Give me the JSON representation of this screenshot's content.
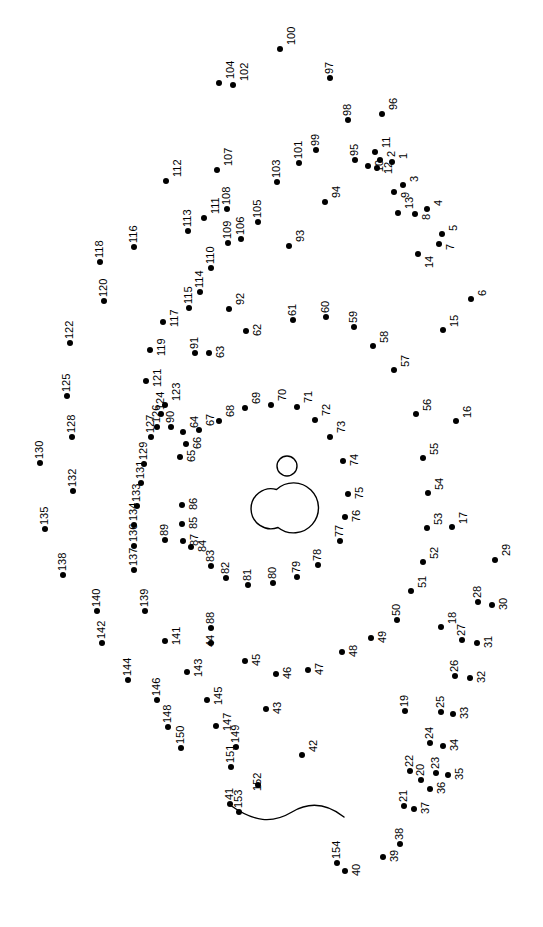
{
  "page": {
    "width": 543,
    "height": 927,
    "background_color": "#ffffff",
    "dot_color": "#000000",
    "label_color": "#000000",
    "label_rotation_degrees": -90,
    "dot_radius_px": 3,
    "total_dots": 154
  },
  "figure": {
    "stroke_color": "#000000",
    "stroke_width": 1.4,
    "fill": "none",
    "shapes": [
      {
        "name": "small-circle-top",
        "type": "circle",
        "cx": 287,
        "cy": 466,
        "r": 10
      },
      {
        "name": "body-circle-large",
        "type": "circle",
        "cx": 297,
        "cy": 508,
        "r": 25
      },
      {
        "name": "body-circle-small",
        "type": "circle",
        "cx": 262,
        "cy": 513,
        "r": 20
      },
      {
        "name": "tail-curve",
        "type": "path",
        "d": "M 230 805 C 254 822, 272 824, 292 812, 312 800, 330 806, 344 817"
      }
    ]
  },
  "dots": [
    {
      "n": "1",
      "x": 392,
      "y": 162,
      "lx": 398,
      "ly": 159
    },
    {
      "n": "2",
      "x": 380,
      "y": 160,
      "lx": 386,
      "ly": 157
    },
    {
      "n": "3",
      "x": 403,
      "y": 185,
      "lx": 409,
      "ly": 182
    },
    {
      "n": "4",
      "x": 427,
      "y": 209,
      "lx": 433,
      "ly": 206
    },
    {
      "n": "5",
      "x": 442,
      "y": 234,
      "lx": 448,
      "ly": 231
    },
    {
      "n": "6",
      "x": 471,
      "y": 299,
      "lx": 477,
      "ly": 296
    },
    {
      "n": "7",
      "x": 439,
      "y": 244,
      "lx": 445,
      "ly": 250
    },
    {
      "n": "8",
      "x": 415,
      "y": 214,
      "lx": 421,
      "ly": 220
    },
    {
      "n": "9",
      "x": 394,
      "y": 192,
      "lx": 400,
      "ly": 198
    },
    {
      "n": "10",
      "x": 368,
      "y": 166,
      "lx": 374,
      "ly": 172
    },
    {
      "n": "11",
      "x": 375,
      "y": 152,
      "lx": 381,
      "ly": 148
    },
    {
      "n": "12",
      "x": 377,
      "y": 168,
      "lx": 383,
      "ly": 174
    },
    {
      "n": "13",
      "x": 398,
      "y": 213,
      "lx": 404,
      "ly": 209
    },
    {
      "n": "14",
      "x": 418,
      "y": 254,
      "lx": 424,
      "ly": 268
    },
    {
      "n": "15",
      "x": 443,
      "y": 330,
      "lx": 449,
      "ly": 327
    },
    {
      "n": "16",
      "x": 456,
      "y": 421,
      "lx": 462,
      "ly": 418
    },
    {
      "n": "17",
      "x": 452,
      "y": 527,
      "lx": 458,
      "ly": 524
    },
    {
      "n": "18",
      "x": 441,
      "y": 627,
      "lx": 447,
      "ly": 624
    },
    {
      "n": "19",
      "x": 405,
      "y": 711,
      "lx": 399,
      "ly": 707
    },
    {
      "n": "20",
      "x": 421,
      "y": 780,
      "lx": 415,
      "ly": 776
    },
    {
      "n": "21",
      "x": 404,
      "y": 806,
      "lx": 398,
      "ly": 802
    },
    {
      "n": "22",
      "x": 410,
      "y": 771,
      "lx": 404,
      "ly": 767
    },
    {
      "n": "23",
      "x": 436,
      "y": 773,
      "lx": 430,
      "ly": 769
    },
    {
      "n": "24",
      "x": 430,
      "y": 743,
      "lx": 424,
      "ly": 739
    },
    {
      "n": "25",
      "x": 441,
      "y": 712,
      "lx": 435,
      "ly": 708
    },
    {
      "n": "26",
      "x": 455,
      "y": 676,
      "lx": 449,
      "ly": 672
    },
    {
      "n": "27",
      "x": 462,
      "y": 640,
      "lx": 456,
      "ly": 636
    },
    {
      "n": "28",
      "x": 478,
      "y": 602,
      "lx": 472,
      "ly": 598
    },
    {
      "n": "29",
      "x": 495,
      "y": 560,
      "lx": 501,
      "ly": 556
    },
    {
      "n": "30",
      "x": 492,
      "y": 605,
      "lx": 498,
      "ly": 610
    },
    {
      "n": "31",
      "x": 477,
      "y": 643,
      "lx": 483,
      "ly": 648
    },
    {
      "n": "32",
      "x": 470,
      "y": 678,
      "lx": 476,
      "ly": 683
    },
    {
      "n": "33",
      "x": 453,
      "y": 714,
      "lx": 459,
      "ly": 719
    },
    {
      "n": "34",
      "x": 443,
      "y": 746,
      "lx": 449,
      "ly": 751
    },
    {
      "n": "35",
      "x": 448,
      "y": 775,
      "lx": 454,
      "ly": 780
    },
    {
      "n": "36",
      "x": 430,
      "y": 789,
      "lx": 436,
      "ly": 794
    },
    {
      "n": "37",
      "x": 414,
      "y": 809,
      "lx": 420,
      "ly": 814
    },
    {
      "n": "38",
      "x": 400,
      "y": 844,
      "lx": 394,
      "ly": 840
    },
    {
      "n": "39",
      "x": 383,
      "y": 857,
      "lx": 389,
      "ly": 862
    },
    {
      "n": "40",
      "x": 345,
      "y": 871,
      "lx": 351,
      "ly": 876
    },
    {
      "n": "41",
      "x": 230,
      "y": 804,
      "lx": 224,
      "ly": 800
    },
    {
      "n": "42",
      "x": 302,
      "y": 755,
      "lx": 308,
      "ly": 752
    },
    {
      "n": "43",
      "x": 266,
      "y": 709,
      "lx": 272,
      "ly": 714
    },
    {
      "n": "44",
      "x": 211,
      "y": 643,
      "lx": 205,
      "ly": 647
    },
    {
      "n": "45",
      "x": 245,
      "y": 661,
      "lx": 251,
      "ly": 666
    },
    {
      "n": "46",
      "x": 276,
      "y": 674,
      "lx": 282,
      "ly": 679
    },
    {
      "n": "47",
      "x": 308,
      "y": 670,
      "lx": 314,
      "ly": 675
    },
    {
      "n": "48",
      "x": 342,
      "y": 652,
      "lx": 348,
      "ly": 657
    },
    {
      "n": "49",
      "x": 371,
      "y": 638,
      "lx": 377,
      "ly": 643
    },
    {
      "n": "50",
      "x": 397,
      "y": 620,
      "lx": 391,
      "ly": 616
    },
    {
      "n": "51",
      "x": 411,
      "y": 591,
      "lx": 417,
      "ly": 588
    },
    {
      "n": "52",
      "x": 423,
      "y": 562,
      "lx": 429,
      "ly": 559
    },
    {
      "n": "53",
      "x": 427,
      "y": 528,
      "lx": 433,
      "ly": 525
    },
    {
      "n": "54",
      "x": 428,
      "y": 493,
      "lx": 434,
      "ly": 490
    },
    {
      "n": "55",
      "x": 423,
      "y": 458,
      "lx": 429,
      "ly": 455
    },
    {
      "n": "56",
      "x": 416,
      "y": 414,
      "lx": 422,
      "ly": 411
    },
    {
      "n": "57",
      "x": 394,
      "y": 370,
      "lx": 400,
      "ly": 367
    },
    {
      "n": "58",
      "x": 373,
      "y": 346,
      "lx": 379,
      "ly": 343
    },
    {
      "n": "59",
      "x": 354,
      "y": 327,
      "lx": 348,
      "ly": 323
    },
    {
      "n": "60",
      "x": 326,
      "y": 317,
      "lx": 320,
      "ly": 313
    },
    {
      "n": "61",
      "x": 293,
      "y": 320,
      "lx": 287,
      "ly": 316
    },
    {
      "n": "62",
      "x": 246,
      "y": 331,
      "lx": 252,
      "ly": 336
    },
    {
      "n": "63",
      "x": 209,
      "y": 353,
      "lx": 215,
      "ly": 358
    },
    {
      "n": "64",
      "x": 183,
      "y": 432,
      "lx": 189,
      "ly": 428
    },
    {
      "n": "65",
      "x": 180,
      "y": 457,
      "lx": 186,
      "ly": 462
    },
    {
      "n": "66",
      "x": 186,
      "y": 444,
      "lx": 192,
      "ly": 449
    },
    {
      "n": "67",
      "x": 199,
      "y": 430,
      "lx": 205,
      "ly": 426
    },
    {
      "n": "68",
      "x": 219,
      "y": 421,
      "lx": 225,
      "ly": 417
    },
    {
      "n": "69",
      "x": 245,
      "y": 408,
      "lx": 251,
      "ly": 404
    },
    {
      "n": "70",
      "x": 271,
      "y": 405,
      "lx": 277,
      "ly": 401
    },
    {
      "n": "71",
      "x": 297,
      "y": 407,
      "lx": 303,
      "ly": 403
    },
    {
      "n": "72",
      "x": 315,
      "y": 420,
      "lx": 321,
      "ly": 416
    },
    {
      "n": "73",
      "x": 330,
      "y": 437,
      "lx": 336,
      "ly": 433
    },
    {
      "n": "74",
      "x": 343,
      "y": 461,
      "lx": 349,
      "ly": 466
    },
    {
      "n": "75",
      "x": 348,
      "y": 494,
      "lx": 354,
      "ly": 499
    },
    {
      "n": "76",
      "x": 345,
      "y": 517,
      "lx": 351,
      "ly": 522
    },
    {
      "n": "77",
      "x": 340,
      "y": 541,
      "lx": 334,
      "ly": 537
    },
    {
      "n": "78",
      "x": 318,
      "y": 565,
      "lx": 312,
      "ly": 561
    },
    {
      "n": "79",
      "x": 297,
      "y": 577,
      "lx": 291,
      "ly": 573
    },
    {
      "n": "80",
      "x": 273,
      "y": 583,
      "lx": 267,
      "ly": 579
    },
    {
      "n": "81",
      "x": 248,
      "y": 585,
      "lx": 242,
      "ly": 581
    },
    {
      "n": "82",
      "x": 226,
      "y": 578,
      "lx": 220,
      "ly": 574
    },
    {
      "n": "83",
      "x": 211,
      "y": 566,
      "lx": 205,
      "ly": 562
    },
    {
      "n": "84",
      "x": 191,
      "y": 547,
      "lx": 197,
      "ly": 552
    },
    {
      "n": "85",
      "x": 182,
      "y": 524,
      "lx": 188,
      "ly": 529
    },
    {
      "n": "86",
      "x": 182,
      "y": 505,
      "lx": 188,
      "ly": 510
    },
    {
      "n": "87",
      "x": 183,
      "y": 541,
      "lx": 189,
      "ly": 546
    },
    {
      "n": "88",
      "x": 211,
      "y": 628,
      "lx": 205,
      "ly": 624
    },
    {
      "n": "89",
      "x": 165,
      "y": 540,
      "lx": 159,
      "ly": 536
    },
    {
      "n": "90",
      "x": 171,
      "y": 427,
      "lx": 165,
      "ly": 423
    },
    {
      "n": "91",
      "x": 195,
      "y": 353,
      "lx": 189,
      "ly": 349
    },
    {
      "n": "92",
      "x": 229,
      "y": 309,
      "lx": 235,
      "ly": 305
    },
    {
      "n": "93",
      "x": 289,
      "y": 246,
      "lx": 295,
      "ly": 242
    },
    {
      "n": "94",
      "x": 325,
      "y": 202,
      "lx": 331,
      "ly": 198
    },
    {
      "n": "95",
      "x": 355,
      "y": 160,
      "lx": 349,
      "ly": 156
    },
    {
      "n": "96",
      "x": 382,
      "y": 114,
      "lx": 388,
      "ly": 110
    },
    {
      "n": "97",
      "x": 330,
      "y": 78,
      "lx": 324,
      "ly": 74
    },
    {
      "n": "98",
      "x": 348,
      "y": 120,
      "lx": 342,
      "ly": 116
    },
    {
      "n": "99",
      "x": 316,
      "y": 150,
      "lx": 310,
      "ly": 146
    },
    {
      "n": "100",
      "x": 280,
      "y": 49,
      "lx": 286,
      "ly": 45
    },
    {
      "n": "101",
      "x": 299,
      "y": 163,
      "lx": 293,
      "ly": 159
    },
    {
      "n": "102",
      "x": 233,
      "y": 85,
      "lx": 239,
      "ly": 81
    },
    {
      "n": "103",
      "x": 277,
      "y": 182,
      "lx": 271,
      "ly": 178
    },
    {
      "n": "104",
      "x": 219,
      "y": 83,
      "lx": 225,
      "ly": 79
    },
    {
      "n": "105",
      "x": 258,
      "y": 222,
      "lx": 252,
      "ly": 218
    },
    {
      "n": "106",
      "x": 241,
      "y": 239,
      "lx": 235,
      "ly": 235
    },
    {
      "n": "107",
      "x": 217,
      "y": 170,
      "lx": 223,
      "ly": 166
    },
    {
      "n": "108",
      "x": 227,
      "y": 209,
      "lx": 221,
      "ly": 205
    },
    {
      "n": "109",
      "x": 228,
      "y": 243,
      "lx": 222,
      "ly": 239
    },
    {
      "n": "110",
      "x": 211,
      "y": 268,
      "lx": 205,
      "ly": 264
    },
    {
      "n": "111",
      "x": 204,
      "y": 218,
      "lx": 210,
      "ly": 214
    },
    {
      "n": "112",
      "x": 166,
      "y": 181,
      "lx": 172,
      "ly": 177
    },
    {
      "n": "113",
      "x": 188,
      "y": 231,
      "lx": 182,
      "ly": 227
    },
    {
      "n": "114",
      "x": 200,
      "y": 292,
      "lx": 194,
      "ly": 288
    },
    {
      "n": "115",
      "x": 189,
      "y": 308,
      "lx": 183,
      "ly": 304
    },
    {
      "n": "116",
      "x": 134,
      "y": 247,
      "lx": 128,
      "ly": 243
    },
    {
      "n": "117",
      "x": 163,
      "y": 322,
      "lx": 169,
      "ly": 327
    },
    {
      "n": "118",
      "x": 100,
      "y": 262,
      "lx": 94,
      "ly": 258
    },
    {
      "n": "119",
      "x": 150,
      "y": 350,
      "lx": 156,
      "ly": 356
    },
    {
      "n": "120",
      "x": 104,
      "y": 301,
      "lx": 98,
      "ly": 297
    },
    {
      "n": "121",
      "x": 146,
      "y": 381,
      "lx": 152,
      "ly": 387
    },
    {
      "n": "122",
      "x": 70,
      "y": 343,
      "lx": 64,
      "ly": 339
    },
    {
      "n": "123",
      "x": 165,
      "y": 405,
      "lx": 171,
      "ly": 401
    },
    {
      "n": "124",
      "x": 161,
      "y": 414,
      "lx": 155,
      "ly": 410
    },
    {
      "n": "125",
      "x": 67,
      "y": 396,
      "lx": 61,
      "ly": 392
    },
    {
      "n": "126",
      "x": 157,
      "y": 427,
      "lx": 151,
      "ly": 423
    },
    {
      "n": "127",
      "x": 151,
      "y": 437,
      "lx": 145,
      "ly": 433
    },
    {
      "n": "128",
      "x": 72,
      "y": 437,
      "lx": 66,
      "ly": 433
    },
    {
      "n": "129",
      "x": 144,
      "y": 464,
      "lx": 138,
      "ly": 460
    },
    {
      "n": "130",
      "x": 40,
      "y": 463,
      "lx": 34,
      "ly": 459
    },
    {
      "n": "131",
      "x": 141,
      "y": 483,
      "lx": 135,
      "ly": 479
    },
    {
      "n": "132",
      "x": 73,
      "y": 491,
      "lx": 67,
      "ly": 487
    },
    {
      "n": "133",
      "x": 137,
      "y": 506,
      "lx": 131,
      "ly": 502
    },
    {
      "n": "134",
      "x": 134,
      "y": 525,
      "lx": 128,
      "ly": 521
    },
    {
      "n": "135",
      "x": 45,
      "y": 529,
      "lx": 39,
      "ly": 525
    },
    {
      "n": "136",
      "x": 134,
      "y": 546,
      "lx": 128,
      "ly": 542
    },
    {
      "n": "137",
      "x": 134,
      "y": 570,
      "lx": 128,
      "ly": 566
    },
    {
      "n": "138",
      "x": 63,
      "y": 575,
      "lx": 57,
      "ly": 571
    },
    {
      "n": "139",
      "x": 145,
      "y": 611,
      "lx": 139,
      "ly": 607
    },
    {
      "n": "140",
      "x": 97,
      "y": 611,
      "lx": 91,
      "ly": 607
    },
    {
      "n": "141",
      "x": 165,
      "y": 641,
      "lx": 171,
      "ly": 645
    },
    {
      "n": "142",
      "x": 102,
      "y": 643,
      "lx": 96,
      "ly": 639
    },
    {
      "n": "143",
      "x": 187,
      "y": 672,
      "lx": 193,
      "ly": 677
    },
    {
      "n": "144",
      "x": 128,
      "y": 680,
      "lx": 122,
      "ly": 676
    },
    {
      "n": "145",
      "x": 207,
      "y": 700,
      "lx": 213,
      "ly": 705
    },
    {
      "n": "146",
      "x": 157,
      "y": 700,
      "lx": 151,
      "ly": 696
    },
    {
      "n": "147",
      "x": 216,
      "y": 726,
      "lx": 222,
      "ly": 731
    },
    {
      "n": "148",
      "x": 168,
      "y": 727,
      "lx": 162,
      "ly": 723
    },
    {
      "n": "149",
      "x": 236,
      "y": 747,
      "lx": 230,
      "ly": 743
    },
    {
      "n": "150",
      "x": 181,
      "y": 748,
      "lx": 175,
      "ly": 744
    },
    {
      "n": "151",
      "x": 231,
      "y": 767,
      "lx": 225,
      "ly": 763
    },
    {
      "n": "152",
      "x": 258,
      "y": 785,
      "lx": 252,
      "ly": 791
    },
    {
      "n": "153",
      "x": 239,
      "y": 812,
      "lx": 233,
      "ly": 808
    },
    {
      "n": "154",
      "x": 337,
      "y": 863,
      "lx": 331,
      "ly": 859
    }
  ]
}
